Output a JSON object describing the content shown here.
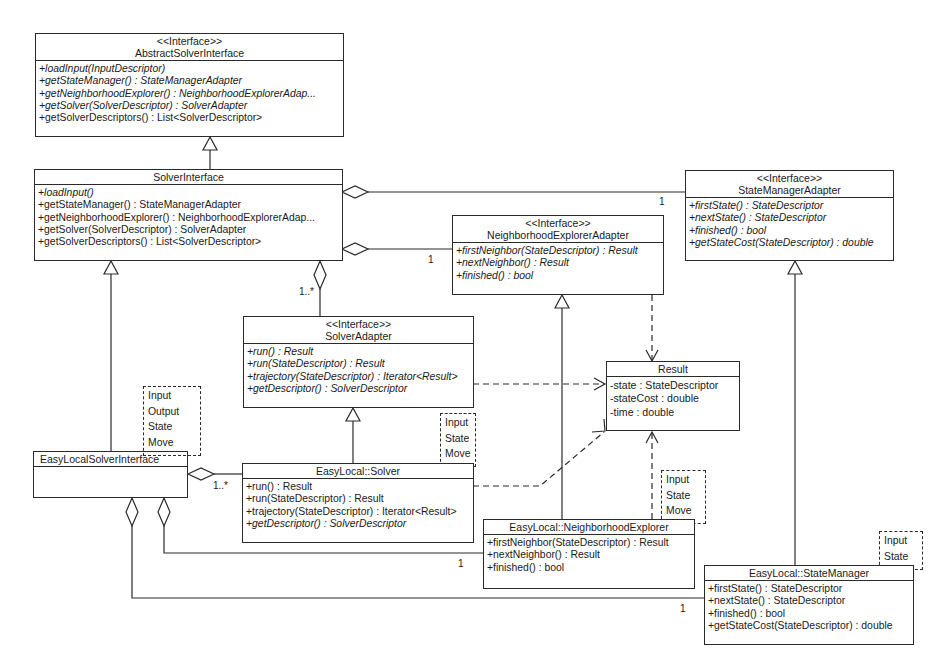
{
  "classes": {
    "abstract_solver_interface": {
      "stereotype": "<<Interface>>",
      "name": "AbstractSolverInterface",
      "operations": [
        {
          "text": "+loadInput(InputDescriptor)",
          "abstract": true
        },
        {
          "text": "+getStateManager() : StateManagerAdapter",
          "abstract": true
        },
        {
          "text": "+getNeighborhoodExplorer() : NeighborhoodExplorerAdap...",
          "abstract": true
        },
        {
          "text": "+getSolver(SolverDescriptor) : SolverAdapter",
          "abstract": true
        },
        {
          "text": "+getSolverDescriptors() : List<SolverDescriptor>",
          "abstract": false
        }
      ]
    },
    "solver_interface": {
      "name": "SolverInterface",
      "operations": [
        {
          "text": "+loadInput()",
          "abstract": true
        },
        {
          "text": "+getStateManager() : StateManagerAdapter",
          "abstract": false
        },
        {
          "text": "+getNeighborhoodExplorer() : NeighborhoodExplorerAdap...",
          "abstract": false
        },
        {
          "text": "+getSolver(SolverDescriptor) : SolverAdapter",
          "abstract": false
        },
        {
          "text": "+getSolverDescriptors() : List<SolverDescriptor>",
          "abstract": false
        }
      ]
    },
    "state_manager_adapter": {
      "stereotype": "<<Interface>>",
      "name": "StateManagerAdapter",
      "operations": [
        {
          "text": "+firstState() : StateDescriptor",
          "abstract": true
        },
        {
          "text": "+nextState() : StateDescriptor",
          "abstract": true
        },
        {
          "text": "+finished() : bool",
          "abstract": true
        },
        {
          "text": "+getStateCost(StateDescriptor) : double",
          "abstract": true
        }
      ]
    },
    "neighborhood_explorer_adapter": {
      "stereotype": "<<Interface>>",
      "name": "NeighborhoodExplorerAdapter",
      "operations": [
        {
          "text": "+firstNeighbor(StateDescriptor) : Result",
          "abstract": true
        },
        {
          "text": "+nextNeighbor() : Result",
          "abstract": true
        },
        {
          "text": "+finished() : bool",
          "abstract": true
        }
      ]
    },
    "solver_adapter": {
      "stereotype": "<<Interface>>",
      "name": "SolverAdapter",
      "operations": [
        {
          "text": "+run() : Result",
          "abstract": true
        },
        {
          "text": "+run(StateDescriptor) : Result",
          "abstract": true
        },
        {
          "text": "+trajectory(StateDescriptor) : Iterator<Result>",
          "abstract": true
        },
        {
          "text": "+getDescriptor() : SolverDescriptor",
          "abstract": true
        }
      ]
    },
    "result": {
      "name": "Result",
      "attributes": [
        "-state : StateDescriptor",
        "-stateCost : double",
        "-time : double"
      ]
    },
    "easylocal_solver_interface": {
      "name": "EasyLocalSolverInterface",
      "template_params": [
        "Input",
        "Output",
        "State",
        "Move"
      ]
    },
    "easylocal_solver": {
      "name": "EasyLocal::Solver",
      "template_params": [
        "Input",
        "State",
        "Move"
      ],
      "operations": [
        {
          "text": "+run() : Result",
          "abstract": false
        },
        {
          "text": "+run(StateDescriptor) : Result",
          "abstract": false
        },
        {
          "text": "+trajectory(StateDescriptor) : Iterator<Result>",
          "abstract": false
        },
        {
          "text": "+getDescriptor() : SolverDescriptor",
          "abstract": true
        }
      ]
    },
    "easylocal_neighborhood_explorer": {
      "name": "EasyLocal::NeighborhoodExplorer",
      "template_params": [
        "Input",
        "State",
        "Move"
      ],
      "operations": [
        {
          "text": "+firstNeighbor(StateDescriptor) : Result",
          "abstract": false
        },
        {
          "text": "+nextNeighbor() : Result",
          "abstract": false
        },
        {
          "text": "+finished() : bool",
          "abstract": false
        }
      ]
    },
    "easylocal_state_manager": {
      "name": "EasyLocal::StateManager",
      "template_params": [
        "Input",
        "State"
      ],
      "operations": [
        {
          "text": "+firstState() : StateDescriptor",
          "abstract": false
        },
        {
          "text": "+nextState() : StateDescriptor",
          "abstract": false
        },
        {
          "text": "+finished() : bool",
          "abstract": false
        },
        {
          "text": "+getStateCost(StateDescriptor) : double",
          "abstract": false
        }
      ]
    }
  },
  "multiplicities": {
    "si_sma": "1",
    "si_nea": "1",
    "si_sa": "1..*",
    "elsi_els": "1..*",
    "elsi_elne": "1",
    "elsi_elsm": "1"
  },
  "relations": [
    {
      "type": "generalization",
      "from": "SolverInterface",
      "to": "AbstractSolverInterface"
    },
    {
      "type": "aggregation",
      "whole": "SolverInterface",
      "part": "StateManagerAdapter",
      "multiplicity": "1"
    },
    {
      "type": "aggregation",
      "whole": "SolverInterface",
      "part": "NeighborhoodExplorerAdapter",
      "multiplicity": "1"
    },
    {
      "type": "aggregation",
      "whole": "SolverInterface",
      "part": "SolverAdapter",
      "multiplicity": "1..*"
    },
    {
      "type": "generalization",
      "from": "EasyLocalSolverInterface",
      "to": "SolverInterface"
    },
    {
      "type": "generalization",
      "from": "EasyLocal::Solver",
      "to": "SolverAdapter"
    },
    {
      "type": "generalization",
      "from": "EasyLocal::NeighborhoodExplorer",
      "to": "NeighborhoodExplorerAdapter"
    },
    {
      "type": "generalization",
      "from": "EasyLocal::StateManager",
      "to": "StateManagerAdapter"
    },
    {
      "type": "dependency",
      "from": "SolverAdapter",
      "to": "Result"
    },
    {
      "type": "dependency",
      "from": "NeighborhoodExplorerAdapter",
      "to": "Result"
    },
    {
      "type": "dependency",
      "from": "EasyLocal::Solver",
      "to": "Result"
    },
    {
      "type": "dependency",
      "from": "EasyLocal::NeighborhoodExplorer",
      "to": "Result"
    },
    {
      "type": "aggregation",
      "whole": "EasyLocalSolverInterface",
      "part": "EasyLocal::Solver",
      "multiplicity": "1..*"
    },
    {
      "type": "aggregation",
      "whole": "EasyLocalSolverInterface",
      "part": "EasyLocal::NeighborhoodExplorer",
      "multiplicity": "1"
    },
    {
      "type": "aggregation",
      "whole": "EasyLocalSolverInterface",
      "part": "EasyLocal::StateManager",
      "multiplicity": "1"
    }
  ]
}
